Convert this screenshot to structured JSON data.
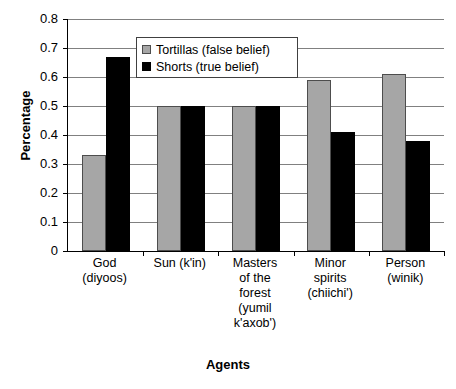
{
  "chart_data": {
    "type": "bar",
    "title": "",
    "xlabel": "Agents",
    "ylabel": "Percentage",
    "ylim": [
      0,
      0.8
    ],
    "grid": true,
    "legend_position": "top-center-inside",
    "categories": [
      "God (diyoos)",
      "Sun (k'in)",
      "Masters of the forest (yumil k'axob')",
      "Minor spirits (chiichi')",
      "Person (winik)"
    ],
    "category_lines": [
      [
        "God",
        "(diyoos)"
      ],
      [
        "Sun (k'in)"
      ],
      [
        "Masters",
        "of the",
        "forest",
        "(yumil",
        "k'axob')"
      ],
      [
        "Minor",
        "spirits",
        "(chiichi')"
      ],
      [
        "Person",
        "(winik)"
      ]
    ],
    "series": [
      {
        "name": "Tortillas (false belief)",
        "color": "#a6a6a6",
        "values": [
          0.33,
          0.5,
          0.5,
          0.59,
          0.61
        ]
      },
      {
        "name": "Shorts (true belief)",
        "color": "#000000",
        "values": [
          0.67,
          0.5,
          0.5,
          0.41,
          0.38
        ]
      }
    ],
    "y_ticks": [
      0,
      0.1,
      0.2,
      0.3,
      0.4,
      0.5,
      0.6,
      0.7,
      0.8
    ],
    "y_tick_labels": [
      "0",
      "0.1",
      "0.2",
      "0.3",
      "0.4",
      "0.5",
      "0.6",
      "0.7",
      "0.8"
    ]
  },
  "axes": {
    "y_title": "Percentage",
    "x_title": "Agents"
  },
  "legend": {
    "items": [
      {
        "label": "Tortillas (false belief)",
        "swatch": "gray-square-swatch"
      },
      {
        "label": "Shorts (true belief)",
        "swatch": "black-square-swatch"
      }
    ]
  }
}
